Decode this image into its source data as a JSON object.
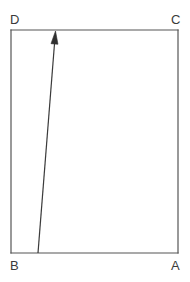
{
  "figure": {
    "background_color": "#ffffff",
    "stroke_color": "#555555",
    "label_color": "#3a3a3a",
    "rectangle": {
      "name": "rectangle-abcd",
      "left": 11,
      "top": 30,
      "right": 178,
      "bottom": 253,
      "stroke_width": 1.2
    },
    "vertices": [
      {
        "id": "D",
        "label": "D",
        "position": "top-left",
        "label_x": 10,
        "label_y": 24
      },
      {
        "id": "C",
        "label": "C",
        "position": "top-right",
        "label_x": 171,
        "label_y": 24
      },
      {
        "id": "B",
        "label": "B",
        "position": "bottom-left",
        "label_x": 10,
        "label_y": 270
      },
      {
        "id": "A",
        "label": "A",
        "position": "bottom-right",
        "label_x": 171,
        "label_y": 270
      }
    ],
    "vector": {
      "name": "vector-arrow",
      "from_x": 38,
      "from_y": 253,
      "to_x": 55.5,
      "to_y": 31,
      "stroke_width": 1.2,
      "arrowhead_width": 7,
      "arrowhead_length": 13
    }
  }
}
